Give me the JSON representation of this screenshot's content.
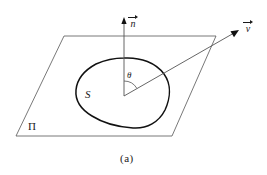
{
  "figure": {
    "caption": "(a)",
    "background_color": "#ffffff",
    "stroke_color": "#1a1a1a",
    "labels": {
      "normal_vector": "n",
      "velocity_vector": "v",
      "angle": "θ",
      "surface": "S",
      "plane": "Π"
    },
    "geometry": {
      "plane": {
        "name": "Π",
        "vertices": [
          [
            64,
            36
          ],
          [
            216,
            36
          ],
          [
            172,
            136
          ],
          [
            16,
            136
          ]
        ]
      },
      "origin_point": [
        124,
        96
      ],
      "normal_vector": {
        "from": [
          124,
          96
        ],
        "to": [
          124,
          20
        ]
      },
      "velocity_vector": {
        "from": [
          124,
          96
        ],
        "to": [
          238,
          31
        ]
      },
      "angle_arc": {
        "center": [
          124,
          96
        ],
        "radius": 15,
        "between": [
          "normal_vector",
          "velocity_vector"
        ]
      },
      "surface_curve": {
        "name": "S",
        "closed": true,
        "bounds": [
          75,
          58,
          170,
          128
        ]
      }
    }
  }
}
